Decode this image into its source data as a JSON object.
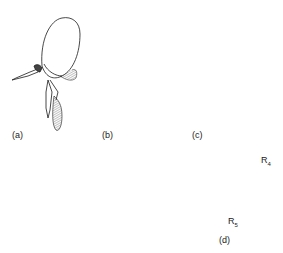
{
  "figure": {
    "panels": [
      {
        "id": "a",
        "label": "(a)",
        "content": "head lateral view with proboscis, antenna"
      },
      {
        "id": "b",
        "label": "(b)",
        "content": "head lateral view with elongate antenna"
      },
      {
        "id": "c",
        "label": "(c)",
        "content": "head lateral view with segmented antenna"
      },
      {
        "id": "d",
        "label": "(d)",
        "content": "wing venation"
      }
    ],
    "wing_labels": {
      "r4": "R",
      "r4_sub": "4",
      "r5": "R",
      "r5_sub": "5"
    },
    "colors": {
      "ink": "#1a1a1a",
      "background": "#ffffff"
    }
  }
}
